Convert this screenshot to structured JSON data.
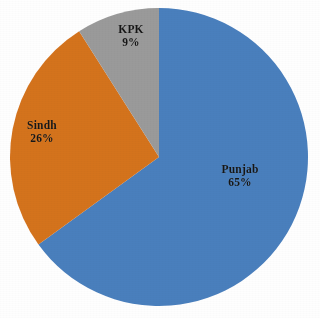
{
  "figure": {
    "background_color": "#fefefe",
    "label_text_color": "#161616"
  },
  "chart_data": {
    "type": "pie",
    "title": "",
    "subtitle": "",
    "xlabel": "",
    "ylabel": "",
    "categories": [
      "Punjab",
      "Sindh",
      "KPK"
    ],
    "values": [
      65,
      26,
      9
    ],
    "value_labels": [
      "65%",
      "26%",
      "9%"
    ],
    "units": "percent",
    "total": 100,
    "start_angle_deg": 0,
    "direction": "clockwise",
    "legend": false,
    "legend_position": "none",
    "grid": false,
    "labels_inside_slices": true,
    "slices": [
      {
        "name": "Punjab",
        "value": 65,
        "value_label": "65%",
        "color": "#4a7fbd",
        "start_angle_deg": 0,
        "end_angle_deg": 234,
        "label_name": "Punjab",
        "label_value": "65%"
      },
      {
        "name": "Sindh",
        "value": 26,
        "value_label": "26%",
        "color": "#d4731f",
        "start_angle_deg": 234,
        "end_angle_deg": 327.6,
        "label_name": "Sindh",
        "label_value": "26%"
      },
      {
        "name": "KPK",
        "value": 9,
        "value_label": "9%",
        "color": "#9a9a9a",
        "start_angle_deg": 327.6,
        "end_angle_deg": 360,
        "label_name": "KPK",
        "label_value": "9%"
      }
    ],
    "geometry": {
      "center_x": 159,
      "center_y": 157,
      "radius": 149
    }
  }
}
